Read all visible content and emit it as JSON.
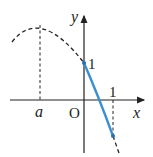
{
  "diagram": {
    "type": "function-graph",
    "axes": {
      "x_label": "x",
      "y_label": "y",
      "origin_label": "O"
    },
    "ticks": {
      "x_one": "1",
      "y_one": "1",
      "x_a": "a"
    },
    "curve": {
      "description": "downward parabola with vertex at x=a; solid blue segment on [0,1]",
      "solid_color": "#3a8fd0",
      "dashed_color": "#222222"
    }
  }
}
